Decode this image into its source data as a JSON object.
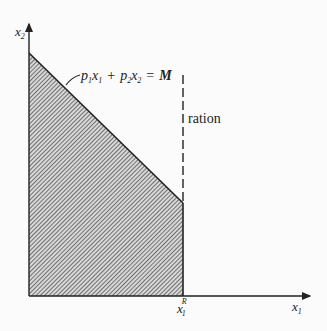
{
  "diagram": {
    "axes": {
      "y_label": "x",
      "y_label_sub": "2",
      "x_label": "x",
      "x_label_sub": "1"
    },
    "budget_line": {
      "label_parts": {
        "p1": "p",
        "p1_sub": "1",
        "x1": "x",
        "x1_sub": "1",
        "plus": "+",
        "p2": "p",
        "p2_sub": "2",
        "x2": "x",
        "x2_sub": "2",
        "eq": "=",
        "M": "M"
      }
    },
    "ration": {
      "label": "ration",
      "tick_label": "x",
      "tick_sub": "1",
      "tick_sup": "R"
    },
    "colors": {
      "ink": "#222222",
      "background": "#fbfbfb",
      "hatch": "#555555"
    }
  }
}
